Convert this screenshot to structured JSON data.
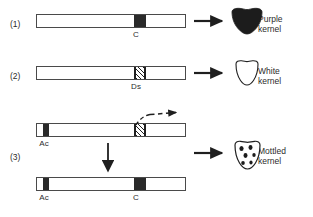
{
  "figure": {
    "background_color": "#ffffff",
    "line_color": "#4a4a4a",
    "fill_color": "#2a2a2a"
  },
  "rows": [
    {
      "id": "row-1",
      "number_label": "(1)",
      "chromosome": {
        "loci": [
          {
            "name": "C",
            "label": "C",
            "style": "solid"
          }
        ]
      },
      "outcome": {
        "kernel_type": "purple",
        "label_line1": "Purple",
        "label_line2": "kernel",
        "arrow": "solid-right-arrow"
      }
    },
    {
      "id": "row-2",
      "number_label": "(2)",
      "chromosome": {
        "loci": [
          {
            "name": "Ds",
            "label": "Ds",
            "style": "hatched"
          }
        ]
      },
      "outcome": {
        "kernel_type": "white",
        "label_line1": "White",
        "label_line2": "kernel",
        "arrow": "solid-right-arrow"
      }
    },
    {
      "id": "row-3",
      "number_label": "(3)",
      "chromosome_top": {
        "loci": [
          {
            "name": "Ac",
            "label": "Ac",
            "style": "solid"
          },
          {
            "name": "Ds",
            "label": "",
            "style": "hatched"
          }
        ],
        "excision_arrow": "dashed-excision-arrow"
      },
      "transition_arrow": "solid-down-arrow",
      "chromosome_bottom": {
        "loci": [
          {
            "name": "Ac",
            "label": "Ac",
            "style": "solid"
          },
          {
            "name": "C",
            "label": "C",
            "style": "solid"
          }
        ]
      },
      "outcome": {
        "kernel_type": "mottled",
        "label_line1": "Mottled",
        "label_line2": "kernel",
        "arrow": "solid-right-arrow"
      }
    }
  ]
}
